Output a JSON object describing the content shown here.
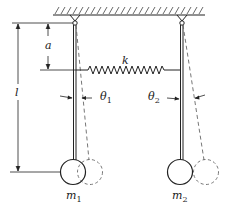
{
  "diagram": {
    "labels": {
      "spring_constant": "k",
      "spring_attach_distance": "a",
      "pendulum_length": "l",
      "angle_left": "θ",
      "angle_left_sub": "1",
      "angle_right": "θ",
      "angle_right_sub": "2",
      "mass_left": "m",
      "mass_left_sub": "1",
      "mass_right": "m",
      "mass_right_sub": "2"
    },
    "colors": {
      "stroke": "#222222",
      "dashed": "#666666",
      "background": "#ffffff"
    }
  }
}
